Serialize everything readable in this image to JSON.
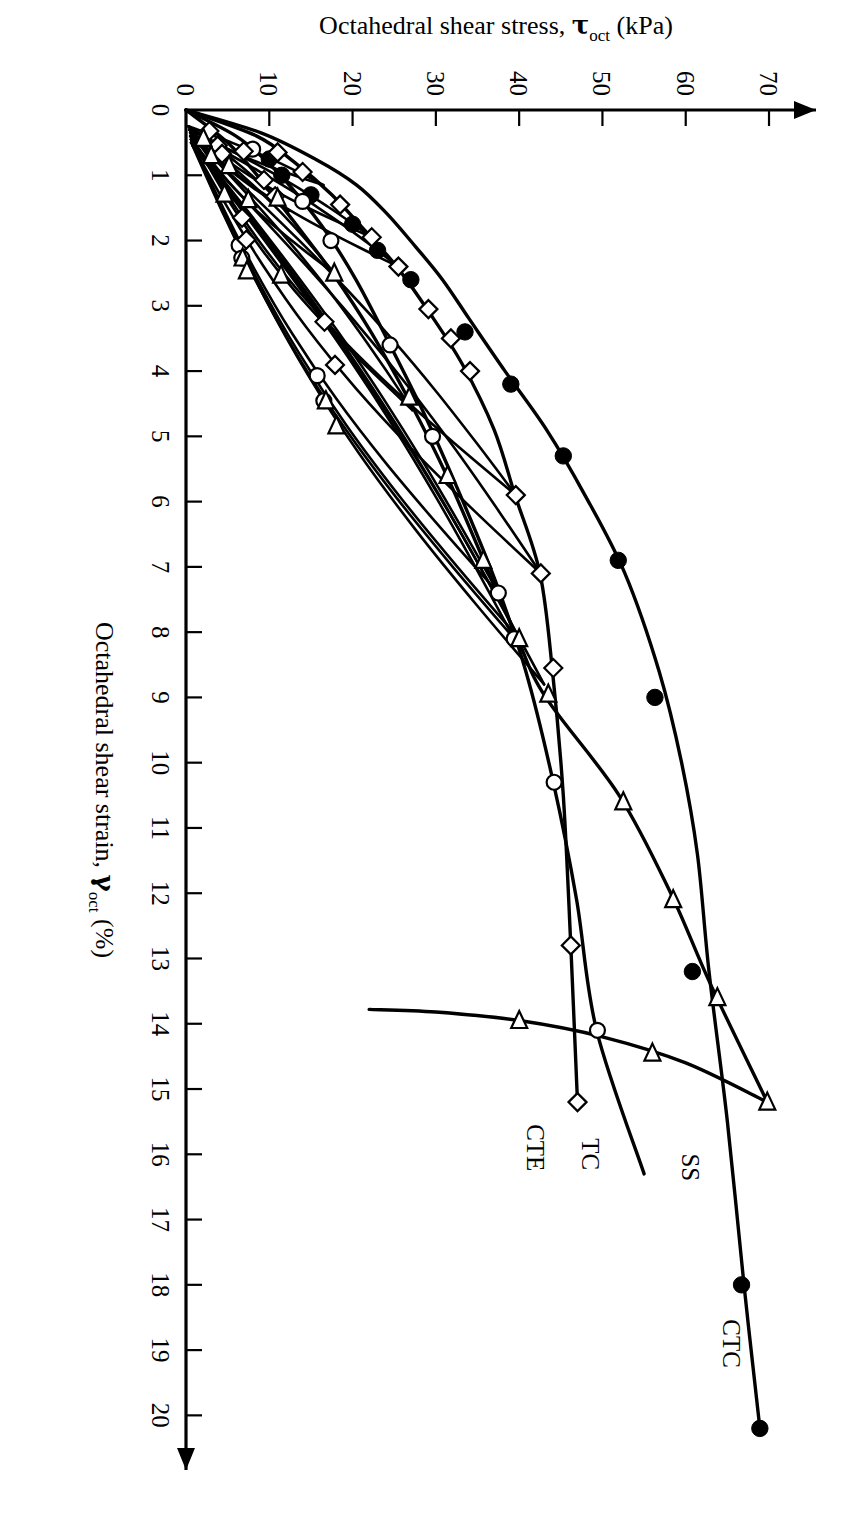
{
  "chart_data": {
    "type": "line",
    "title": "",
    "xlabel": "Octahedral shear strain, γoct (%)",
    "xlabel_main": "Octahedral shear strain, ",
    "xlabel_symbol": "γ",
    "xlabel_sub": "oct",
    "xlabel_unit": " (%)",
    "ylabel": "Octahedral shear stress, τoct (kPa)",
    "ylabel_main": "Octahedral shear stress, ",
    "ylabel_symbol": "τ",
    "ylabel_sub": "oct",
    "ylabel_unit": " (kPa)",
    "xlim": [
      0,
      20.5
    ],
    "ylim": [
      0,
      73
    ],
    "xticks": [
      0,
      1,
      2,
      3,
      4,
      5,
      6,
      7,
      8,
      9,
      10,
      11,
      12,
      13,
      14,
      15,
      16,
      17,
      18,
      19,
      20
    ],
    "yticks": [
      0,
      10,
      20,
      30,
      40,
      50,
      60,
      70
    ],
    "xtick_labels": [
      "0",
      "1",
      "2",
      "3",
      "4",
      "5",
      "6",
      "7",
      "8",
      "9",
      "10",
      "11",
      "12",
      "13",
      "14",
      "15",
      "16",
      "17",
      "18",
      "19",
      "20"
    ],
    "ytick_labels": [
      "0",
      "10",
      "20",
      "30",
      "40",
      "50",
      "60",
      "70"
    ],
    "grid": false,
    "legend_position": "inline-annotations",
    "axis_arrows": true,
    "orientation": "rotated-90-ccw",
    "series": [
      {
        "name": "CTC",
        "label": "CTC",
        "marker": "filled-circle",
        "label_point": {
          "x": 18.9,
          "y": 64.5
        },
        "backbone": [
          [
            0.0,
            0.0
          ],
          [
            0.35,
            9.0
          ],
          [
            0.75,
            15.5
          ],
          [
            1.15,
            20.5
          ],
          [
            1.6,
            24.2
          ],
          [
            2.1,
            27.6
          ],
          [
            2.6,
            30.8
          ],
          [
            3.2,
            34.0
          ],
          [
            4.0,
            38.3
          ],
          [
            4.9,
            43.3
          ],
          [
            5.9,
            47.9
          ],
          [
            7.1,
            52.7
          ],
          [
            8.6,
            56.8
          ],
          [
            10.0,
            59.5
          ],
          [
            11.4,
            61.4
          ],
          [
            13.2,
            62.8
          ],
          [
            15.5,
            65.0
          ],
          [
            18.0,
            67.0
          ],
          [
            20.2,
            68.9
          ]
        ],
        "markers": [
          [
            0.75,
            10.0
          ],
          [
            1.0,
            11.5
          ],
          [
            1.3,
            15.0
          ],
          [
            1.75,
            20.0
          ],
          [
            2.15,
            23.0
          ],
          [
            2.6,
            27.0
          ],
          [
            3.4,
            33.5
          ],
          [
            4.2,
            39.0
          ],
          [
            5.3,
            45.3
          ],
          [
            6.9,
            51.9
          ],
          [
            9.0,
            56.3
          ],
          [
            13.2,
            60.8
          ],
          [
            18.0,
            66.7
          ],
          [
            20.2,
            68.9
          ]
        ]
      },
      {
        "name": "SS",
        "label": "SS",
        "marker": "open-circle",
        "label_point": {
          "x": 16.2,
          "y": 59.5
        },
        "backbone": [
          [
            0.0,
            0.0
          ],
          [
            0.4,
            6.0
          ],
          [
            0.8,
            9.8
          ],
          [
            1.3,
            13.4
          ],
          [
            1.9,
            17.0
          ],
          [
            2.6,
            20.4
          ],
          [
            3.5,
            24.1
          ],
          [
            4.6,
            28.4
          ],
          [
            5.8,
            32.6
          ],
          [
            7.2,
            37.1
          ],
          [
            8.6,
            40.8
          ],
          [
            10.3,
            44.1
          ],
          [
            12.1,
            46.9
          ],
          [
            14.1,
            49.3
          ],
          [
            16.3,
            55.0
          ]
        ],
        "markers": [
          [
            0.6,
            8.0
          ],
          [
            1.4,
            14.0
          ],
          [
            2.0,
            17.4
          ],
          [
            3.6,
            24.5
          ],
          [
            5.0,
            29.6
          ],
          [
            7.4,
            37.5
          ],
          [
            8.1,
            39.4
          ],
          [
            10.3,
            44.2
          ],
          [
            14.1,
            49.4
          ]
        ],
        "loops": [
          {
            "peak_x": 7.4,
            "peak_y": 37.5,
            "min_x": 0.45,
            "min_y": 0.6
          },
          {
            "peak_x": 8.1,
            "peak_y": 39.4,
            "min_x": 0.55,
            "min_y": 0.8
          }
        ]
      },
      {
        "name": "TC",
        "label": "TC",
        "marker": "open-diamond",
        "label_point": {
          "x": 16.0,
          "y": 47.5
        },
        "backbone": [
          [
            0.0,
            0.0
          ],
          [
            0.4,
            8.5
          ],
          [
            0.8,
            13.0
          ],
          [
            1.3,
            17.5
          ],
          [
            1.85,
            21.5
          ],
          [
            2.4,
            25.3
          ],
          [
            3.1,
            29.2
          ],
          [
            3.9,
            33.2
          ],
          [
            4.9,
            37.0
          ],
          [
            5.9,
            39.5
          ],
          [
            7.1,
            42.5
          ],
          [
            8.6,
            44.0
          ],
          [
            10.5,
            45.3
          ],
          [
            12.8,
            46.2
          ],
          [
            15.2,
            47.0
          ]
        ],
        "markers": [
          [
            0.65,
            11.0
          ],
          [
            0.95,
            14.0
          ],
          [
            1.45,
            18.5
          ],
          [
            1.95,
            22.3
          ],
          [
            2.4,
            25.5
          ],
          [
            3.05,
            29.1
          ],
          [
            3.5,
            31.8
          ],
          [
            4.0,
            34.1
          ],
          [
            5.9,
            39.6
          ],
          [
            7.1,
            42.6
          ],
          [
            8.55,
            44.1
          ],
          [
            12.8,
            46.2
          ],
          [
            15.2,
            47.0
          ]
        ],
        "loops": [
          {
            "peak_x": 1.95,
            "peak_y": 22.3,
            "min_x": 0.3,
            "min_y": 0.4
          },
          {
            "peak_x": 2.4,
            "peak_y": 25.5,
            "min_x": 0.35,
            "min_y": 0.5
          },
          {
            "peak_x": 5.9,
            "peak_y": 39.6,
            "min_x": 0.4,
            "min_y": 0.5
          },
          {
            "peak_x": 7.1,
            "peak_y": 42.6,
            "min_x": 0.5,
            "min_y": 0.6
          },
          {
            "peak_x": 1.15,
            "peak_y": 16.5,
            "min_x": 0.25,
            "min_y": 0.3
          }
        ]
      },
      {
        "name": "CTE",
        "label": "CTE",
        "marker": "open-triangle-left",
        "label_point": {
          "x": 15.9,
          "y": 41.0
        },
        "backbone": [
          [
            0.0,
            0.0
          ],
          [
            0.5,
            5.0
          ],
          [
            1.1,
            9.2
          ],
          [
            1.8,
            13.5
          ],
          [
            2.5,
            17.6
          ],
          [
            3.4,
            22.2
          ],
          [
            4.5,
            27.0
          ],
          [
            5.6,
            31.3
          ],
          [
            6.8,
            35.4
          ],
          [
            8.1,
            39.8
          ],
          [
            9.0,
            43.2
          ],
          [
            10.5,
            52.0
          ],
          [
            12.0,
            58.2
          ],
          [
            13.4,
            63.0
          ],
          [
            15.2,
            69.8
          ]
        ],
        "markers": [
          [
            1.35,
            11.0
          ],
          [
            2.5,
            17.8
          ],
          [
            4.4,
            26.8
          ],
          [
            5.6,
            31.4
          ],
          [
            6.9,
            35.7
          ],
          [
            8.1,
            40.0
          ],
          [
            8.95,
            43.5
          ],
          [
            10.6,
            52.5
          ],
          [
            12.1,
            58.5
          ],
          [
            13.6,
            63.8
          ],
          [
            15.2,
            69.8
          ]
        ],
        "loops": [
          {
            "peak_x": 2.5,
            "peak_y": 17.8,
            "min_x": 0.3,
            "min_y": 0.4
          },
          {
            "peak_x": 4.6,
            "peak_y": 27.2,
            "min_x": 0.35,
            "min_y": 0.5
          },
          {
            "peak_x": 8.1,
            "peak_y": 40.0,
            "min_x": 0.45,
            "min_y": 0.6
          },
          {
            "peak_x": 8.8,
            "peak_y": 43.0,
            "min_x": 0.5,
            "min_y": 0.7
          },
          {
            "peak_x": 1.55,
            "peak_y": 12.3,
            "min_x": 0.25,
            "min_y": 0.3
          }
        ],
        "final_unload": [
          [
            15.2,
            69.8
          ],
          [
            14.6,
            60.0
          ],
          [
            14.2,
            50.0
          ],
          [
            13.95,
            40.0
          ],
          [
            13.82,
            30.0
          ],
          [
            13.78,
            22.0
          ]
        ]
      }
    ]
  }
}
